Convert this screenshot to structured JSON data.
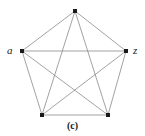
{
  "figure": {
    "caption": "(c)",
    "background_color": "#ffffff",
    "edge_color": "#8a8a8a",
    "vertex_color": "#1a1a1a",
    "label_color": "#1a1a1a"
  },
  "chart_data": {
    "type": "diagram",
    "title": "(c)",
    "graph_type": "complete graph K5",
    "nodes": [
      {
        "id": "top",
        "label": "",
        "x": 75,
        "y": 11
      },
      {
        "id": "left",
        "label": "a",
        "x": 22,
        "y": 51
      },
      {
        "id": "right",
        "label": "z",
        "x": 126,
        "y": 51
      },
      {
        "id": "bottom_left",
        "label": "",
        "x": 42,
        "y": 115
      },
      {
        "id": "bottom_right",
        "label": "",
        "x": 108,
        "y": 115
      }
    ],
    "edges": [
      {
        "from": "top",
        "to": "left"
      },
      {
        "from": "top",
        "to": "right"
      },
      {
        "from": "left",
        "to": "bottom_left"
      },
      {
        "from": "right",
        "to": "bottom_right"
      },
      {
        "from": "bottom_left",
        "to": "bottom_right"
      },
      {
        "from": "left",
        "to": "right"
      },
      {
        "from": "top",
        "to": "bottom_left"
      },
      {
        "from": "top",
        "to": "bottom_right"
      },
      {
        "from": "left",
        "to": "bottom_right"
      },
      {
        "from": "right",
        "to": "bottom_left"
      }
    ],
    "node_labels": {
      "left": "a",
      "right": "z"
    },
    "edge_count": 10,
    "node_count": 5
  }
}
